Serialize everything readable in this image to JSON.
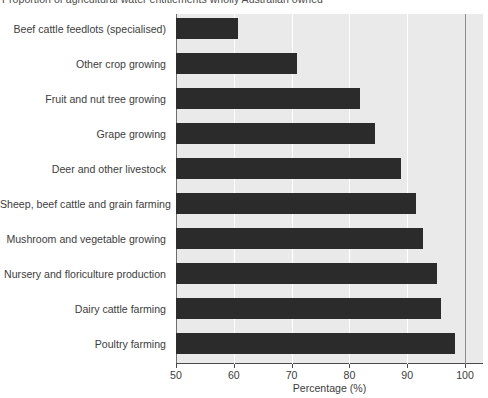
{
  "chart_data": {
    "type": "bar",
    "orientation": "horizontal",
    "title": "Proportion of agricultural water entitlements wholly Australian owned",
    "xlabel": "Percentage (%)",
    "ylabel": "",
    "xlim": [
      50,
      100
    ],
    "xticks": [
      50,
      60,
      70,
      80,
      90,
      100
    ],
    "xticklabels": [
      "50",
      "60",
      "70",
      "80",
      "90",
      "100"
    ],
    "grid": true,
    "legend": null,
    "bar_color": "#2b2b2b",
    "plot_background": "#eaeaea",
    "gridline_color": "#ffffff",
    "categories": [
      "Beef cattle feedlots (specialised)",
      "Other crop growing",
      "Fruit and nut tree growing",
      "Grape growing",
      "Deer and other livestock",
      "Sheep, beef cattle and grain farming",
      "Mushroom and vegetable growing",
      "Nursery and floriculture production",
      "Dairy cattle farming",
      "Poultry farming"
    ],
    "values": [
      60.7,
      71.0,
      81.9,
      84.4,
      89.0,
      91.6,
      92.8,
      95.1,
      95.9,
      98.3
    ]
  }
}
